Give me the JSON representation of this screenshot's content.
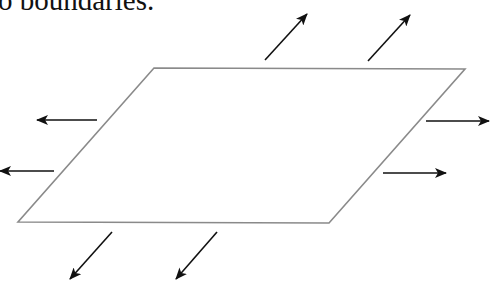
{
  "caption": {
    "text": "o boundaries."
  },
  "diagram": {
    "colors": {
      "sheet_edge": "#8a8a8a",
      "arrow": "#111111",
      "background": "#ffffff"
    },
    "sheet": {
      "corners": [
        [
          154,
          68
        ],
        [
          465,
          69
        ],
        [
          329,
          223
        ],
        [
          18,
          222
        ]
      ]
    },
    "arrows": [
      {
        "id": "top-1",
        "from": [
          265,
          60
        ],
        "to": [
          307,
          14
        ],
        "direction": "up-right"
      },
      {
        "id": "top-2",
        "from": [
          368,
          61
        ],
        "to": [
          410,
          15
        ],
        "direction": "up-right"
      },
      {
        "id": "left-1",
        "from": [
          97,
          120
        ],
        "to": [
          37,
          120
        ],
        "direction": "left"
      },
      {
        "id": "left-2",
        "from": [
          54,
          171
        ],
        "to": [
          0,
          171
        ],
        "direction": "left"
      },
      {
        "id": "right-1",
        "from": [
          426,
          121
        ],
        "to": [
          489,
          121
        ],
        "direction": "right"
      },
      {
        "id": "right-2",
        "from": [
          383,
          173
        ],
        "to": [
          446,
          173
        ],
        "direction": "right"
      },
      {
        "id": "bottom-1",
        "from": [
          112,
          232
        ],
        "to": [
          70,
          279
        ],
        "direction": "down-left"
      },
      {
        "id": "bottom-2",
        "from": [
          217,
          232
        ],
        "to": [
          176,
          279
        ],
        "direction": "down-left"
      }
    ]
  }
}
